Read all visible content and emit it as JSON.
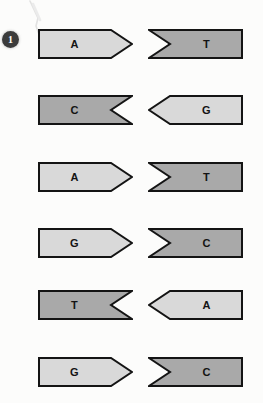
{
  "figure": {
    "background_color": "#fcfcfb",
    "marker": {
      "label": "1",
      "name": "step-number-marker",
      "fill_color": "#3b3b3b",
      "text_color": "#ffffff"
    },
    "artifact": {
      "name": "scan-artifact",
      "description": "faint diagonal pencil smudge"
    }
  },
  "style": {
    "light_fill": "#d9d9d9",
    "dark_fill": "#a9a9a9",
    "outline_color": "#141414",
    "label_color": "#131313"
  },
  "pairs": [
    {
      "row": 1,
      "top": 29,
      "left": {
        "letter": "A",
        "shade": "light",
        "fill": "#d9d9d9",
        "shape": "point-right",
        "x": 38,
        "width": 95
      },
      "right": {
        "letter": "T",
        "shade": "dark",
        "fill": "#a9a9a9",
        "shape": "notch-left",
        "x": 148,
        "width": 95
      }
    },
    {
      "row": 2,
      "top": 95,
      "left": {
        "letter": "C",
        "shade": "dark",
        "fill": "#a9a9a9",
        "shape": "notch-right",
        "x": 38,
        "width": 95
      },
      "right": {
        "letter": "G",
        "shade": "light",
        "fill": "#d9d9d9",
        "shape": "point-left",
        "x": 148,
        "width": 95
      }
    },
    {
      "row": 3,
      "top": 162,
      "left": {
        "letter": "A",
        "shade": "light",
        "fill": "#d9d9d9",
        "shape": "point-right",
        "x": 38,
        "width": 95
      },
      "right": {
        "letter": "T",
        "shade": "dark",
        "fill": "#a9a9a9",
        "shape": "notch-left",
        "x": 148,
        "width": 95
      }
    },
    {
      "row": 4,
      "top": 228,
      "left": {
        "letter": "G",
        "shade": "light",
        "fill": "#d9d9d9",
        "shape": "point-right",
        "x": 38,
        "width": 95
      },
      "right": {
        "letter": "C",
        "shade": "dark",
        "fill": "#a9a9a9",
        "shape": "notch-left",
        "x": 148,
        "width": 95
      }
    },
    {
      "row": 5,
      "top": 290,
      "left": {
        "letter": "T",
        "shade": "dark",
        "fill": "#a9a9a9",
        "shape": "notch-right",
        "x": 38,
        "width": 95
      },
      "right": {
        "letter": "A",
        "shade": "light",
        "fill": "#d9d9d9",
        "shape": "point-left",
        "x": 148,
        "width": 95
      }
    },
    {
      "row": 6,
      "top": 357,
      "left": {
        "letter": "G",
        "shade": "light",
        "fill": "#d9d9d9",
        "shape": "point-right",
        "x": 38,
        "width": 95
      },
      "right": {
        "letter": "C",
        "shade": "dark",
        "fill": "#a9a9a9",
        "shape": "notch-left",
        "x": 148,
        "width": 95
      }
    }
  ]
}
